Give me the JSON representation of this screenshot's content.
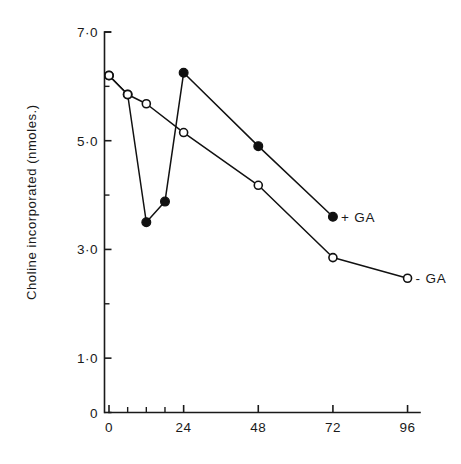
{
  "chart_data": {
    "type": "line",
    "title": "",
    "xlabel": "",
    "ylabel": "Choline incorporated (nmoles.)",
    "xlim": [
      0,
      100
    ],
    "ylim": [
      0,
      7
    ],
    "grid": false,
    "legend_position": "inline-right-of-series-end",
    "x_ticks_major": [
      0,
      24,
      48,
      72,
      96
    ],
    "x_tick_labels": [
      "0",
      "24",
      "48",
      "72",
      "96"
    ],
    "x_ticks_minor": [
      6,
      12,
      18
    ],
    "y_ticks_major": [
      0,
      1.0,
      3.0,
      5.0,
      7.0
    ],
    "y_tick_labels": [
      "0",
      "1·0",
      "3·0",
      "5·0",
      "7·0"
    ],
    "y_ticks_minor": [
      2.0,
      4.0,
      6.0
    ],
    "series": [
      {
        "name": "+ GA",
        "marker": "filled-circle",
        "x": [
          0,
          6,
          12,
          18,
          24,
          48,
          72
        ],
        "values": [
          6.2,
          5.85,
          3.5,
          3.88,
          6.25,
          4.9,
          3.6
        ]
      },
      {
        "name": "- GA",
        "marker": "open-circle",
        "x": [
          0,
          6,
          12,
          24,
          48,
          72,
          96
        ],
        "values": [
          6.2,
          5.85,
          5.68,
          5.15,
          4.18,
          2.85,
          2.47
        ]
      }
    ]
  },
  "labels": {
    "plus_ga": "+ GA",
    "minus_ga": "- GA",
    "y_axis_title": "Choline incorporated (nmoles.)"
  },
  "colors": {
    "ink": "#111111",
    "background": "#ffffff"
  }
}
